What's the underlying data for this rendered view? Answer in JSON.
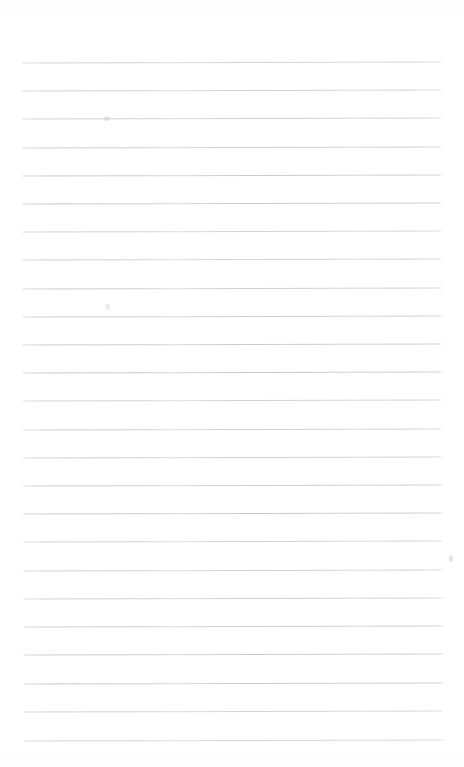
{
  "document": {
    "kind": "scanned-lined-paper",
    "title": "",
    "visible_text": "",
    "background_color": "#ffffff",
    "page_width": 464,
    "page_height": 767
  },
  "ruling": {
    "line_color": "#c9c9ce",
    "line_thickness_px": 1,
    "line_count": 25,
    "left_margin_px": 23,
    "right_margin_px": 440,
    "line_length_px": 417,
    "first_line_y_px": 62,
    "line_spacing_px": 28.2,
    "last_line_y_px": 740,
    "tilt_degrees": -0.16,
    "line_y_positions": [
      62,
      90,
      118,
      147,
      175,
      203,
      231,
      259,
      288,
      316,
      344,
      372,
      400,
      429,
      457,
      485,
      513,
      541,
      570,
      598,
      626,
      654,
      683,
      711,
      740
    ]
  },
  "marks": [
    {
      "name": "smudge-upper-left",
      "x": 104,
      "y": 116,
      "w": 6,
      "h": 5,
      "color": "rgba(195,195,200,0.38)"
    },
    {
      "name": "smudge-mid-left",
      "x": 105,
      "y": 304,
      "w": 5,
      "h": 6,
      "color": "rgba(198,198,203,0.33)"
    },
    {
      "name": "smudge-right-edge",
      "x": 449,
      "y": 555,
      "w": 4,
      "h": 7,
      "color": "rgba(190,190,196,0.42)"
    }
  ]
}
